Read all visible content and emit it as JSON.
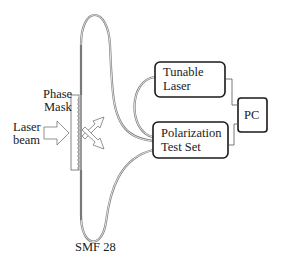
{
  "diagram": {
    "labels": {
      "phase_mask_line1": "Phase",
      "phase_mask_line2": "Mask",
      "laser_beam_line1": "Laser",
      "laser_beam_line2": "beam",
      "fiber": "SMF 28"
    },
    "boxes": {
      "tunable_laser": {
        "line1": "Tunable",
        "line2": "Laser"
      },
      "polarization_test_set": {
        "line1": "Polarization",
        "line2": "Test Set"
      },
      "pc": {
        "line1": "PC"
      }
    },
    "colors": {
      "stroke": "#1a1a1a",
      "fiber": "#7a7a7a",
      "background": "#ffffff"
    }
  }
}
